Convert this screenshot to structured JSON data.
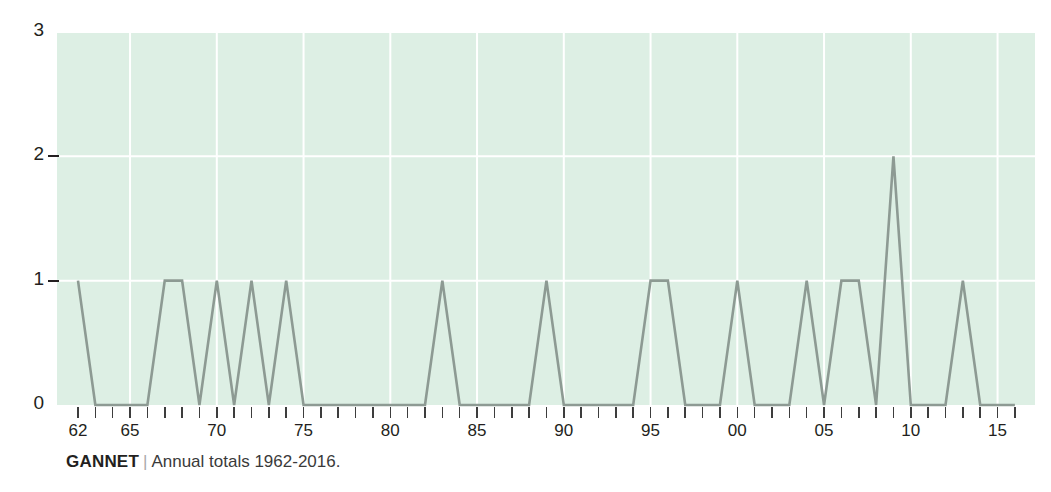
{
  "caption": {
    "series_name": "GANNET",
    "separator": "|",
    "description": "Annual totals 1962-2016."
  },
  "chart_data": {
    "type": "line",
    "title": "",
    "subtitle": "",
    "xlabel": "",
    "ylabel": "",
    "ylim": [
      0,
      3
    ],
    "xlim": [
      1962,
      2016
    ],
    "yticks": [
      0,
      1,
      2,
      3
    ],
    "ytick_labels": [
      "0",
      "1",
      "2",
      "3"
    ],
    "xtick_years": [
      1962,
      1965,
      1970,
      1975,
      1980,
      1985,
      1990,
      1995,
      2000,
      2005,
      2010,
      2015
    ],
    "xtick_labels": [
      "62",
      "65",
      "70",
      "75",
      "80",
      "85",
      "90",
      "95",
      "00",
      "05",
      "10",
      "15"
    ],
    "grid": true,
    "grid_color": "#ffffff",
    "legend": "none",
    "plot_background": "#ddefe4",
    "line_color": "#8d9a93",
    "line_width": 2.6,
    "x": [
      1962,
      1963,
      1964,
      1965,
      1966,
      1967,
      1968,
      1969,
      1970,
      1971,
      1972,
      1973,
      1974,
      1975,
      1976,
      1977,
      1978,
      1979,
      1980,
      1981,
      1982,
      1983,
      1984,
      1985,
      1986,
      1987,
      1988,
      1989,
      1990,
      1991,
      1992,
      1993,
      1994,
      1995,
      1996,
      1997,
      1998,
      1999,
      2000,
      2001,
      2002,
      2003,
      2004,
      2005,
      2006,
      2007,
      2008,
      2009,
      2010,
      2011,
      2012,
      2013,
      2014,
      2015,
      2016
    ],
    "values": [
      1,
      0,
      0,
      0,
      0,
      1,
      1,
      0,
      1,
      0,
      1,
      0,
      1,
      0,
      0,
      0,
      0,
      0,
      0,
      0,
      0,
      1,
      0,
      0,
      0,
      0,
      0,
      1,
      0,
      0,
      0,
      0,
      0,
      1,
      1,
      0,
      0,
      0,
      1,
      0,
      0,
      0,
      1,
      0,
      1,
      1,
      0,
      2,
      0,
      0,
      0,
      1,
      0,
      0,
      0
    ],
    "series": [
      {
        "name": "GANNET",
        "values": [
          1,
          0,
          0,
          0,
          0,
          1,
          1,
          0,
          1,
          0,
          1,
          0,
          1,
          0,
          0,
          0,
          0,
          0,
          0,
          0,
          0,
          1,
          0,
          0,
          0,
          0,
          0,
          1,
          0,
          0,
          0,
          0,
          0,
          1,
          1,
          0,
          0,
          0,
          1,
          0,
          0,
          0,
          1,
          0,
          1,
          1,
          0,
          2,
          0,
          0,
          0,
          1,
          0,
          0,
          0
        ]
      }
    ]
  }
}
